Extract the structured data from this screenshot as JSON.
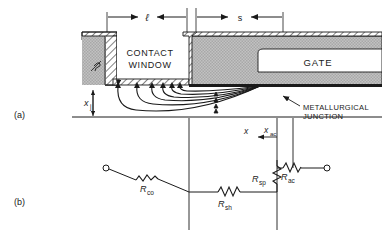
{
  "figure": {
    "panel_a_label": "(a)",
    "panel_b_label": "(b)"
  },
  "cross_section": {
    "dim_length_label": "ℓ",
    "dim_spacing_label": "s",
    "contact_window_line1": "CONTACT",
    "contact_window_line2": "WINDOW",
    "gate_label": "GATE",
    "junction_depth_label": "x",
    "junction_depth_sub": "j",
    "metallurgical_line1": "METALLURGICAL",
    "metallurgical_line2": "JUNCTION",
    "axis_x_label": "x",
    "x_ac_label": "x",
    "x_ac_sub": "ac"
  },
  "circuit": {
    "r_co_label": "R",
    "r_co_sub": "co",
    "r_sh_label": "R",
    "r_sh_sub": "sh",
    "r_sp_label": "R",
    "r_sp_sub": "sp",
    "r_ac_label": "R",
    "r_ac_sub": "ac"
  },
  "colors": {
    "ink": "#1a1a1a",
    "metal_fill": "#b9b9b9",
    "oxide_fill": "#ffffff",
    "background": "#ffffff"
  }
}
